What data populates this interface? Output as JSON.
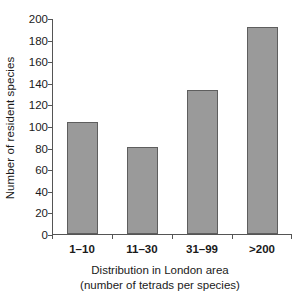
{
  "chart_data": {
    "type": "bar",
    "title": "",
    "subtitle": "",
    "categories": [
      "1–10",
      "11–30",
      "31–99",
      ">200"
    ],
    "values": [
      104,
      81,
      133,
      192
    ],
    "xlabel": "Distribution in London area",
    "xlabel_line2": "(number of tetrads per species)",
    "ylabel": "Number of resident species",
    "ylim": [
      0,
      200
    ],
    "ytick_values": [
      0,
      20,
      40,
      60,
      80,
      100,
      120,
      140,
      160,
      180,
      200
    ],
    "ytick_labels": [
      "0",
      "20",
      "40",
      "60",
      "80",
      "100",
      "120",
      "140",
      "160",
      "180",
      "200"
    ],
    "grid": false,
    "legend": null,
    "legend_position": "none",
    "bar_fill_color": "#9a9a9a",
    "bar_edge_color": "#5e5e5e",
    "axis_color": "#555555",
    "background_color": "#ffffff"
  }
}
